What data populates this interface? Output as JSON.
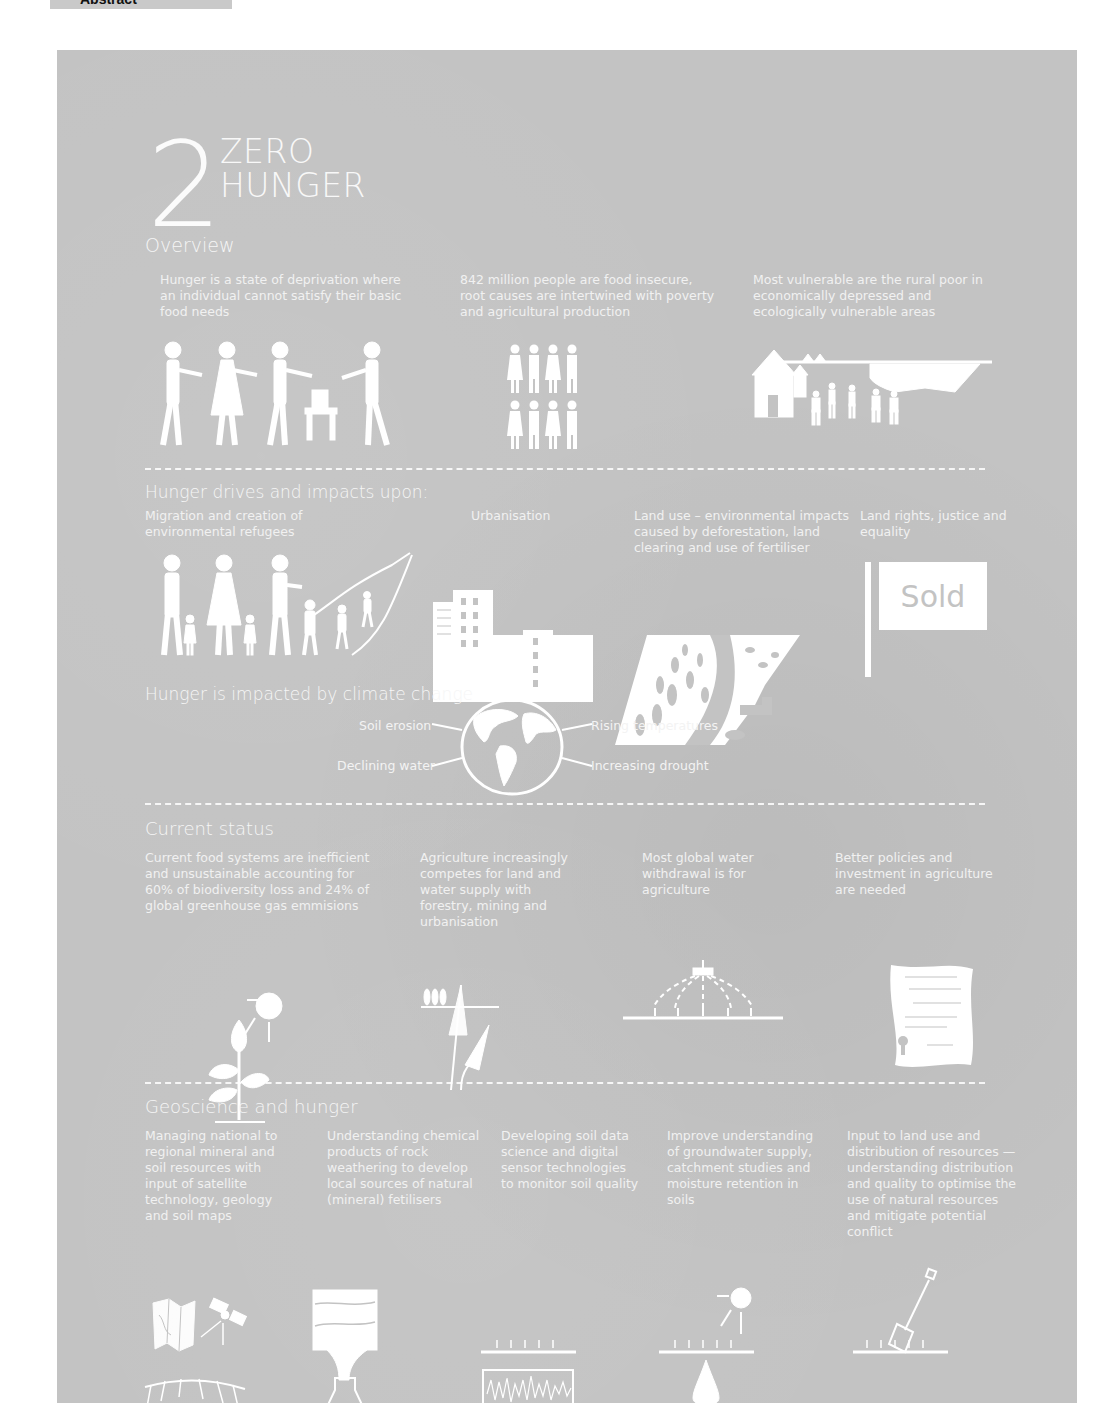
{
  "top_tab": {
    "label": "Abstract"
  },
  "goal": {
    "number": "2",
    "title_line1": "ZERO",
    "title_line2": "HUNGER"
  },
  "sections": {
    "overview": {
      "heading": "Overview",
      "items": [
        {
          "text": "Hunger is a state of deprivation where an individual cannot satisfy their basic food needs",
          "icon": "people-sharing-food-icon"
        },
        {
          "text": "842 million people are food insecure, root causes are intertwined with poverty and agricultural production",
          "icon": "group-of-people-icon"
        },
        {
          "text": "Most vulnerable are the rural poor in economically depressed and ecologically vulnerable areas",
          "icon": "rural-village-icon"
        }
      ]
    },
    "drives": {
      "heading": "Hunger drives and impacts upon:",
      "items": [
        {
          "text": "Migration and creation of environmental refugees",
          "icon": "migrating-family-icon"
        },
        {
          "text": "Urbanisation",
          "icon": "city-buildings-icon"
        },
        {
          "text": "Land use – environmental impacts caused by deforestation, land clearing and use of fertiliser",
          "icon": "deforestation-icon"
        },
        {
          "text": "Land rights, justice and equality",
          "icon": "sold-sign-icon",
          "sign_text": "Sold"
        }
      ]
    },
    "climate": {
      "heading": "Hunger is impacted by climate change",
      "labels": {
        "soil_erosion": "Soil erosion",
        "declining_water": "Declining water",
        "rising_temperatures": "Rising temperatures",
        "increasing_drought": "Increasing drought"
      },
      "icon": "globe-icon"
    },
    "current": {
      "heading": "Current status",
      "items": [
        {
          "text": "Current food systems are inefficient and unsustainable accounting for 60% of biodiversity loss and 24% of global greenhouse gas emmisions",
          "icon": "plant-and-sun-icon"
        },
        {
          "text": "Agriculture increasingly competes for land and water supply with forestry, mining and urbanisation",
          "icon": "wheat-and-trees-icon"
        },
        {
          "text": "Most global water withdrawal is for agriculture",
          "icon": "irrigation-sprinkler-icon"
        },
        {
          "text": "Better policies and investment in agriculture are needed",
          "icon": "policy-document-icon"
        }
      ]
    },
    "geoscience": {
      "heading": "Geoscience and hunger",
      "items": [
        {
          "text": "Managing national to regional mineral and soil resources with input of satellite technology, geology and soil maps",
          "icon": "map-and-satellite-icon"
        },
        {
          "text": "Understanding chemical products of rock weathering to develop local sources of natural (mineral) fetilisers",
          "icon": "rock-layers-flask-icon"
        },
        {
          "text": "Developing soil data science and digital sensor technologies to monitor soil quality",
          "icon": "soil-sensor-waveform-icon"
        },
        {
          "text": "Improve understanding of groundwater supply, catchment studies and moisture retention in soils",
          "icon": "groundwater-drop-icon"
        },
        {
          "text": "Input to land use and distribution of resources — understanding distribution and quality to optimise the use of natural resources and mitigate potential conflict",
          "icon": "spade-in-soil-icon"
        }
      ]
    }
  },
  "colors": {
    "panel_bg": "#c3c3c3",
    "foreground": "#ffffff",
    "tab_bg": "#c9c9c9"
  }
}
